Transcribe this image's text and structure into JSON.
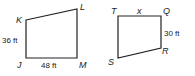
{
  "figures": [
    {
      "name": "quadrilateral-JKLM",
      "vertices": {
        "K": "K",
        "L": "L",
        "J": "J",
        "M": "M"
      },
      "measures": {
        "JK": "36 ft",
        "JM": "48 ft"
      }
    },
    {
      "name": "quadrilateral-TQRS",
      "vertices": {
        "T": "T",
        "Q": "Q",
        "R": "R",
        "S": "S"
      },
      "measures": {
        "TQ": "x",
        "QR": "30 ft"
      }
    }
  ],
  "colors": {
    "stroke": "#222222",
    "background": "#ffffff"
  }
}
